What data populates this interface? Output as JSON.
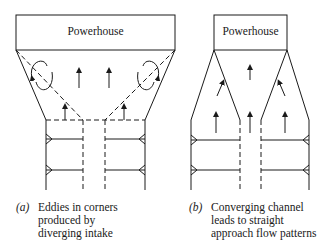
{
  "diagram_a": {
    "powerhouse_label": "Powerhouse",
    "caption_tag": "(a)",
    "caption_lines": [
      "Eddies in corners",
      "produced by",
      "diverging intake"
    ]
  },
  "diagram_b": {
    "powerhouse_label": "Powerhouse",
    "caption_tag": "(b)",
    "caption_lines": [
      "Converging channel",
      "leads to straight",
      "approach flow patterns"
    ]
  },
  "colors": {
    "line": "#1a1a1a",
    "background": "#ffffff"
  }
}
